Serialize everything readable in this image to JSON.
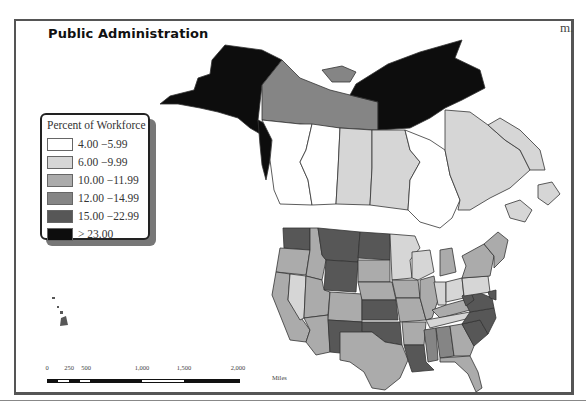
{
  "map": {
    "title": "Public Administration",
    "corner_mark": "m.",
    "region": "North America (Canada, United States)",
    "legend": {
      "title": "Percent of Workforce",
      "classes": [
        {
          "label": "4.00 −5.99",
          "color": "#ffffff"
        },
        {
          "label": "6.00 −9.99",
          "color": "#d6d6d6"
        },
        {
          "label": "10.00 −11.99",
          "color": "#ababab"
        },
        {
          "label": "12.00 −14.99",
          "color": "#858585"
        },
        {
          "label": "15.00 −22.99",
          "color": "#575757"
        },
        {
          "label": "> 23.00",
          "color": "#0d0d0d"
        }
      ]
    },
    "scale_bar": {
      "ticks": [
        "0",
        "250",
        "500",
        "1,000",
        "1,500",
        "2,000"
      ],
      "units": "Miles"
    }
  },
  "colors": {
    "frame": "#555555",
    "border": "#333333",
    "water": "#ffffff"
  }
}
